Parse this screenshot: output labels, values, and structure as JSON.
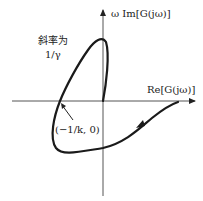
{
  "diagram": {
    "type": "popov-plot",
    "x_axis_label": "Re[G(jω)]",
    "y_axis_label": "ω Im[G(jω)]",
    "slope_label_line1": "斜率为",
    "slope_label_line2": "1/γ",
    "point_label": "(−1/k, 0)",
    "colors": {
      "axis": "#555555",
      "curve": "#1a1a1a",
      "text": "#222222"
    }
  }
}
